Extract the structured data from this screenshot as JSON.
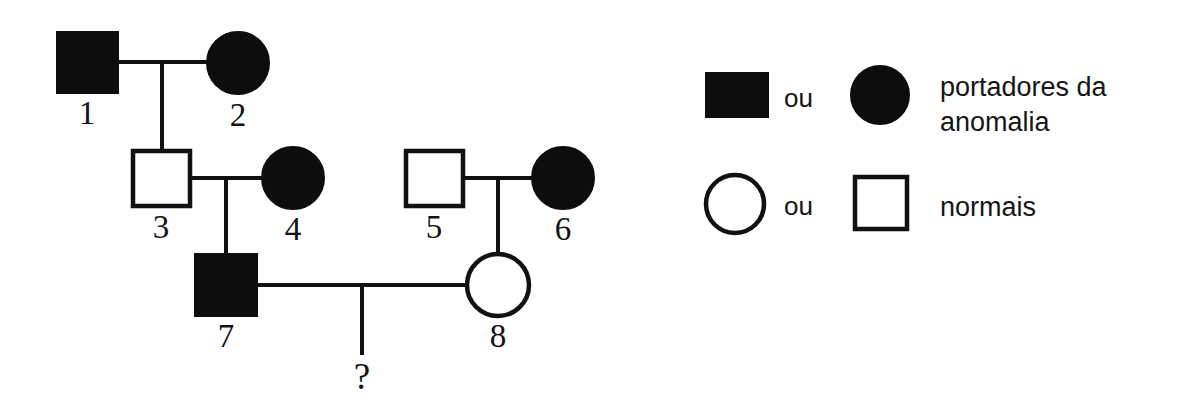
{
  "diagram": {
    "question_marker": "?",
    "individuals": [
      {
        "id": "1",
        "label": "1",
        "sex": "male",
        "shape": "square",
        "status": "affected",
        "fill": "filled",
        "generation": 1,
        "x": 87,
        "y": 62,
        "size": 61
      },
      {
        "id": "2",
        "label": "2",
        "sex": "female",
        "shape": "circle",
        "status": "affected",
        "fill": "filled",
        "generation": 1,
        "x": 238,
        "y": 63,
        "size": 62
      },
      {
        "id": "3",
        "label": "3",
        "sex": "male",
        "shape": "square",
        "status": "normal",
        "fill": "open",
        "generation": 2,
        "x": 161,
        "y": 178,
        "size": 57
      },
      {
        "id": "4",
        "label": "4",
        "sex": "female",
        "shape": "circle",
        "status": "affected",
        "fill": "filled",
        "generation": 2,
        "x": 293,
        "y": 178,
        "size": 62
      },
      {
        "id": "5",
        "label": "5",
        "sex": "male",
        "shape": "square",
        "status": "normal",
        "fill": "open",
        "generation": 2,
        "x": 434,
        "y": 178,
        "size": 57
      },
      {
        "id": "6",
        "label": "6",
        "sex": "female",
        "shape": "circle",
        "status": "affected",
        "fill": "filled",
        "generation": 2,
        "x": 563,
        "y": 178,
        "size": 62
      },
      {
        "id": "7",
        "label": "7",
        "sex": "male",
        "shape": "square",
        "status": "affected",
        "fill": "filled",
        "generation": 3,
        "x": 226,
        "y": 285,
        "size": 62
      },
      {
        "id": "8",
        "label": "8",
        "sex": "female",
        "shape": "circle",
        "status": "normal",
        "fill": "open",
        "generation": 3,
        "x": 498,
        "y": 285,
        "size": 62
      }
    ],
    "matings": [
      {
        "name": "mating-1x2",
        "parents": [
          "1",
          "2"
        ],
        "child_ids": [
          "3"
        ]
      },
      {
        "name": "mating-3x4",
        "parents": [
          "3",
          "4"
        ],
        "child_ids": [
          "7"
        ]
      },
      {
        "name": "mating-5x6",
        "parents": [
          "5",
          "6"
        ],
        "child_ids": [
          "8"
        ]
      },
      {
        "name": "mating-7x8",
        "parents": [
          "7",
          "8"
        ],
        "child_ids": [
          "?"
        ]
      }
    ],
    "unknown_offspring": {
      "name": "unknown-child",
      "symbol": "?",
      "x": 362,
      "y": 378
    }
  },
  "legend": {
    "rows": [
      {
        "name": "legend-row-affected",
        "shape_a": "filled-square",
        "connector": "ou",
        "shape_b": "filled-circle",
        "description_line1": "portadores da",
        "description_line2": "anomalia"
      },
      {
        "name": "legend-row-normal",
        "shape_a": "open-circle",
        "connector": "ou",
        "shape_b": "open-square",
        "description_line1": "normais",
        "description_line2": ""
      }
    ]
  },
  "colors": {
    "ink": "#111111",
    "affected_fill": "#0d0d0d",
    "normal_fill": "#ffffff",
    "background": "#ffffff"
  }
}
